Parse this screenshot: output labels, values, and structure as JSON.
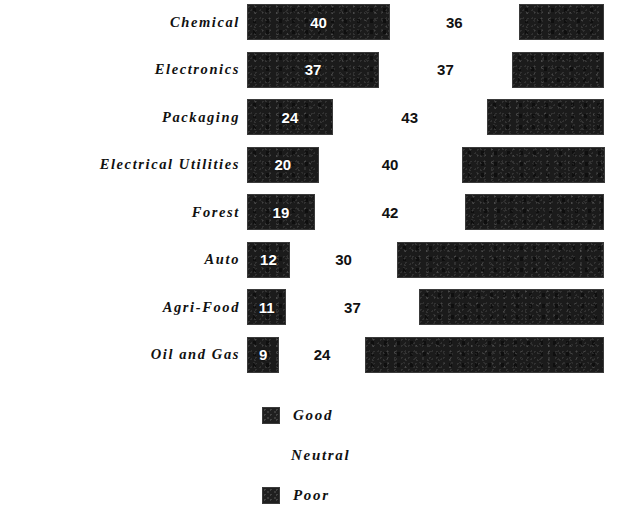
{
  "chart_data": {
    "type": "bar",
    "subtype": "horizontal-stacked",
    "title": "",
    "subtitle": "",
    "xlabel": "",
    "ylabel": "",
    "grid": false,
    "axis_visible": false,
    "xlim": [
      0,
      100
    ],
    "legend_position": "bottom-center",
    "value_unit": "percent",
    "categories": [
      "Chemical",
      "Electronics",
      "Packaging",
      "Electrical Utilities",
      "Forest",
      "Auto",
      "Agri-Food",
      "Oil and Gas"
    ],
    "series": [
      {
        "name": "Good",
        "color": "#1b1b1b",
        "label_color": "#ffffff",
        "values": [
          40,
          37,
          24,
          20,
          19,
          12,
          11,
          9
        ]
      },
      {
        "name": "Neutral",
        "color": "#ffffff",
        "label_color": "#111111",
        "values": [
          36,
          37,
          43,
          40,
          42,
          30,
          37,
          24
        ]
      },
      {
        "name": "Poor",
        "color": "#1b1b1b",
        "label_color": "#ffffff",
        "values": [
          24,
          26,
          33,
          40,
          39,
          58,
          52,
          67
        ]
      }
    ],
    "legend_entries": [
      {
        "label": "Good",
        "swatch": "dark"
      },
      {
        "label": "Neutral",
        "swatch": "blank"
      },
      {
        "label": "Poor",
        "swatch": "dark"
      }
    ]
  },
  "rows": [
    {
      "label": "Chemical",
      "good": 40,
      "neutral": 36
    },
    {
      "label": "Electronics",
      "good": 37,
      "neutral": 37
    },
    {
      "label": "Packaging",
      "good": 24,
      "neutral": 43
    },
    {
      "label": "Electrical Utilities",
      "good": 20,
      "neutral": 40
    },
    {
      "label": "Forest",
      "good": 19,
      "neutral": 42
    },
    {
      "label": "Auto",
      "good": 12,
      "neutral": 30
    },
    {
      "label": "Agri-Food",
      "good": 11,
      "neutral": 37
    },
    {
      "label": "Oil and Gas",
      "good": 9,
      "neutral": 24
    }
  ],
  "legend": {
    "good_label": "Good",
    "neutral_label": "Neutral",
    "poor_label": "Poor"
  },
  "colors": {
    "bar_dark": "#1b1b1b",
    "background": "#ffffff",
    "text": "#111111",
    "value_on_dark": "#ffffff"
  }
}
